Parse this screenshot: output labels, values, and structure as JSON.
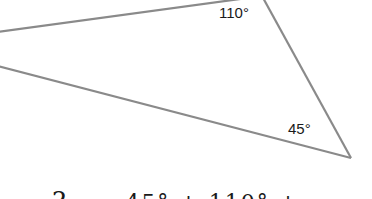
{
  "figure": {
    "type": "triangle",
    "stroke_color": "#8a8a8a",
    "angles": [
      {
        "label": "110°",
        "vertex": "top"
      },
      {
        "label": "45°",
        "vertex": "bottom-right"
      }
    ]
  },
  "equation": {
    "unknown": "?",
    "rest": "=  45°  +  110°  +  ..."
  }
}
